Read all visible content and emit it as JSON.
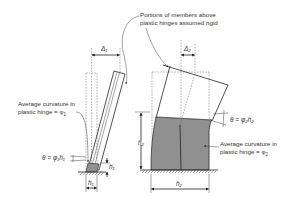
{
  "figure": {
    "type": "structural engineering diagram"
  },
  "annotations": {
    "rigid_portions": {
      "line1": "Portions of members above",
      "line2": "plastic hinges assumed rigid"
    },
    "curvature_1": {
      "line1": "Average curvature in",
      "line2": "plastic hinge = φ",
      "subscript": "1"
    },
    "curvature_2": {
      "line1": "Average curvature in",
      "line2": "plastic hinge = φ",
      "subscript": "2"
    },
    "rotation_1": "θ = φ₁h₁",
    "rotation_2": "θ = φ₂h₂"
  },
  "dimensions": {
    "delta_1": "Δ₁",
    "delta_2": "Δ₂",
    "h1_vertical": "h₁",
    "h1_horizontal": "h₁",
    "h2_vertical": "h₂",
    "h2_horizontal": "h₂"
  },
  "colors": {
    "line": "#222222",
    "hatch": "#555555",
    "background": "#ffffff"
  }
}
